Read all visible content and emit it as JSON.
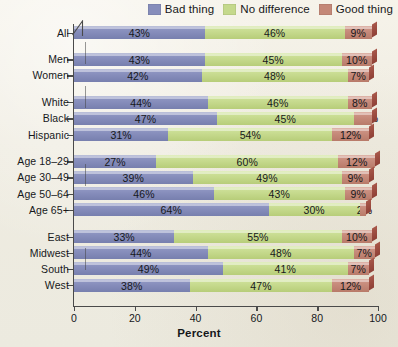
{
  "legend": {
    "items": [
      {
        "label": "Bad thing",
        "color": "#868dbb",
        "key": "bad"
      },
      {
        "label": "No difference",
        "color": "#c5d98c",
        "key": "nodiff"
      },
      {
        "label": "Good thing",
        "color": "#c48878",
        "key": "good"
      }
    ]
  },
  "axis": {
    "x_title": "Percent",
    "x_ticks": [
      "0",
      "20",
      "40",
      "60",
      "80",
      "100"
    ]
  },
  "chart_data": {
    "type": "bar",
    "orientation": "horizontal",
    "stacked": true,
    "title": "",
    "xlabel": "Percent",
    "ylabel": "",
    "xlim": [
      0,
      100
    ],
    "grid": false,
    "legend_position": "top-right",
    "categories": [
      "All",
      "Men",
      "Women",
      "White",
      "Black",
      "Hispanic",
      "Age 18–29",
      "Age 30–49",
      "Age 50–64",
      "Age 65+",
      "East",
      "Midwest",
      "South",
      "West"
    ],
    "groups": [
      {
        "name": "Total",
        "categories": [
          "All"
        ]
      },
      {
        "name": "Gender",
        "categories": [
          "Men",
          "Women"
        ]
      },
      {
        "name": "Race/Ethnicity",
        "categories": [
          "White",
          "Black",
          "Hispanic"
        ]
      },
      {
        "name": "Age",
        "categories": [
          "Age 18–29",
          "Age 30–49",
          "Age 50–64",
          "Age 65+"
        ]
      },
      {
        "name": "Region",
        "categories": [
          "East",
          "Midwest",
          "South",
          "West"
        ]
      }
    ],
    "series": [
      {
        "name": "Bad thing",
        "color": "#868dbb",
        "values": [
          43,
          43,
          42,
          44,
          47,
          31,
          27,
          39,
          46,
          64,
          33,
          44,
          49,
          38
        ]
      },
      {
        "name": "No difference",
        "color": "#c5d98c",
        "values": [
          46,
          45,
          48,
          46,
          45,
          54,
          60,
          49,
          43,
          30,
          55,
          48,
          41,
          47
        ]
      },
      {
        "name": "Good thing",
        "color": "#c48878",
        "values": [
          9,
          10,
          7,
          8,
          6,
          12,
          12,
          9,
          9,
          2,
          10,
          7,
          7,
          12
        ]
      }
    ],
    "labels": {
      "bad": [
        "43%",
        "43%",
        "42%",
        "44%",
        "47%",
        "31%",
        "27%",
        "39%",
        "46%",
        "64%",
        "33%",
        "44%",
        "49%",
        "38%"
      ],
      "nodiff": [
        "46%",
        "45%",
        "48%",
        "46%",
        "45%",
        "54%",
        "60%",
        "49%",
        "43%",
        "30%",
        "55%",
        "48%",
        "41%",
        "47%"
      ],
      "good": [
        "9%",
        "10%",
        "7%",
        "8%",
        "6%",
        "12%",
        "12%",
        "9%",
        "9%",
        "2%",
        "10%",
        "7%",
        "7%",
        "12%"
      ]
    }
  }
}
